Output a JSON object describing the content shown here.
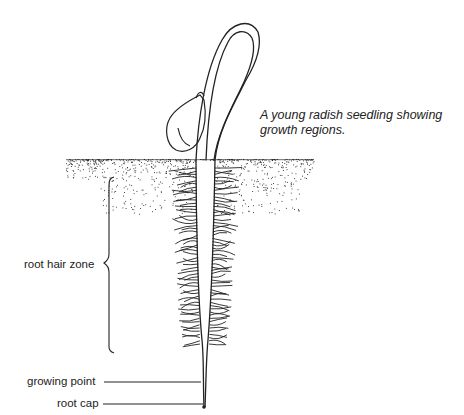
{
  "figure": {
    "caption": "A young radish seedling showing growth regions.",
    "caption_lines": [
      "A young radish seedling showing",
      "growth regions."
    ],
    "labels": {
      "root_hair_zone": "root hair zone",
      "growing_point": "growing point",
      "root_cap": "root cap"
    },
    "parts": [
      "cotyledon",
      "hypocotyl stem",
      "soil surface",
      "root hairs",
      "root tip"
    ],
    "colors": {
      "ink": "#222222",
      "background": "#ffffff"
    }
  }
}
